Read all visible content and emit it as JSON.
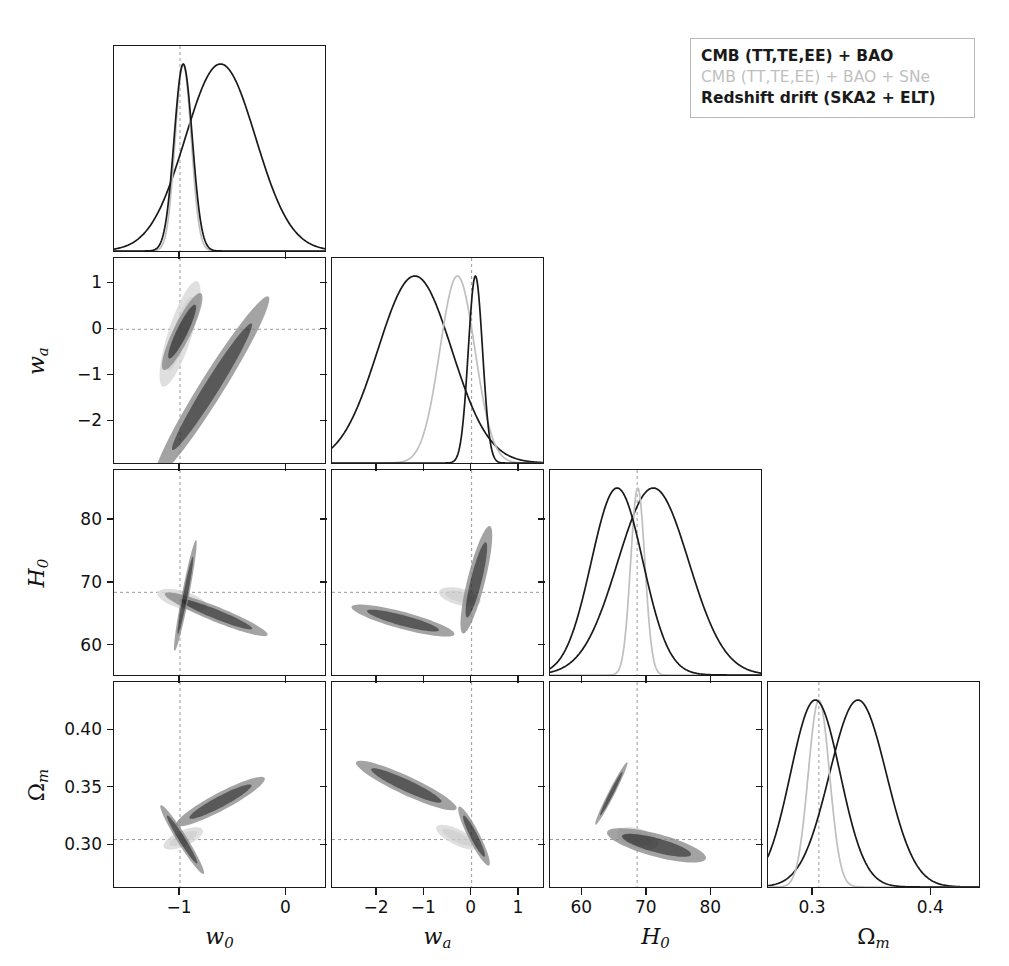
{
  "figure": {
    "type": "corner-plot",
    "background": "#ffffff",
    "frame_color": "#1a1a1a"
  },
  "legend": {
    "position": "top-right",
    "entries": [
      {
        "label": "CMB (TT,TE,EE) + BAO",
        "color": "#1a1a1a",
        "style": "bold"
      },
      {
        "label": "CMB (TT,TE,EE) + BAO + SNe",
        "color": "#bfbfbf",
        "style": "grey"
      },
      {
        "label": "Redshift drift (SKA2 + ELT)",
        "color": "#1a1a1a",
        "style": "bold"
      }
    ]
  },
  "parameters": [
    {
      "key": "w0",
      "label": "w",
      "sub": "0",
      "range": [
        -1.62,
        0.38
      ],
      "ticks": [
        -1,
        0
      ],
      "ticklabels": [
        "−1",
        "0"
      ],
      "fiducial": -1.0
    },
    {
      "key": "wa",
      "label": "w",
      "sub": "a",
      "range": [
        -2.95,
        1.55
      ],
      "ticks": [
        -2,
        -1,
        0,
        1
      ],
      "ticklabels": [
        "−2",
        "−1",
        "0",
        "1"
      ],
      "fiducial": 0.0
    },
    {
      "key": "H0",
      "label": "H",
      "sub": "0",
      "range": [
        55.0,
        88.0
      ],
      "ticks": [
        60,
        70,
        80
      ],
      "ticklabels": [
        "60",
        "70",
        "80"
      ],
      "fiducial": 68.5
    },
    {
      "key": "Omegam",
      "label": "Ω",
      "sub": "m",
      "range": [
        0.262,
        0.442
      ],
      "ticks": [
        0.3,
        0.35,
        0.4
      ],
      "ticklabels": [
        "0.30",
        "0.35",
        "0.40"
      ],
      "fiducial": 0.305,
      "xticks": [
        0.3,
        0.4
      ],
      "xticklabels": [
        "0.3",
        "0.4"
      ]
    }
  ],
  "chart_data": {
    "type": "line",
    "title": "",
    "xlabel": "",
    "ylabel": "",
    "grid": false,
    "legend_position": "top-right",
    "panel_kind": "corner",
    "axes": {
      "w0": {
        "label": "w0",
        "min": -1.62,
        "max": 0.38,
        "tick_values": [
          -1,
          0
        ]
      },
      "wa": {
        "label": "wa",
        "min": -2.95,
        "max": 1.55,
        "tick_values": [
          -2,
          -1,
          0,
          1
        ]
      },
      "H0": {
        "label": "H0",
        "min": 55.0,
        "max": 88.0,
        "tick_values": [
          60,
          70,
          80
        ]
      },
      "Omegam": {
        "label": "Omega_m",
        "min": 0.262,
        "max": 0.442,
        "tick_values": [
          0.3,
          0.35,
          0.4
        ]
      }
    },
    "series": [
      {
        "name": "CMB (TT,TE,EE) + BAO",
        "color": "#1a1a1a",
        "fill_68": "#2b2b2b",
        "fill_95": "#8a8a8a"
      },
      {
        "name": "CMB (TT,TE,EE) + BAO + SNe",
        "color": "#bfbfbf",
        "fill_68": "#c9c9c9",
        "fill_95": "#d8d8d8"
      },
      {
        "name": "Redshift drift (SKA2 + ELT)",
        "color": "#1a1a1a",
        "fill_68": "#2b2b2b",
        "fill_95": "#8a8a8a"
      }
    ],
    "marginals": {
      "w0": [
        {
          "series": "CMB (TT,TE,EE) + BAO",
          "peak": -0.62,
          "sigma": 0.33
        },
        {
          "series": "CMB (TT,TE,EE) + BAO + SNe",
          "peak": -0.97,
          "sigma": 0.075
        },
        {
          "series": "Redshift drift (SKA2 + ELT)",
          "peak": -0.97,
          "sigma": 0.085
        }
      ],
      "wa": [
        {
          "series": "CMB (TT,TE,EE) + BAO",
          "peak": -1.2,
          "sigma": 0.78
        },
        {
          "series": "CMB (TT,TE,EE) + BAO + SNe",
          "peak": -0.3,
          "sigma": 0.37
        },
        {
          "series": "Redshift drift (SKA2 + ELT)",
          "peak": 0.08,
          "sigma": 0.15
        }
      ],
      "H0": [
        {
          "series": "CMB (TT,TE,EE) + BAO",
          "peak": 71.0,
          "sigma": 5.5
        },
        {
          "series": "CMB (TT,TE,EE) + BAO + SNe",
          "peak": 68.6,
          "sigma": 1.1
        },
        {
          "series": "Redshift drift (SKA2 + ELT)",
          "peak": 65.4,
          "sigma": 4.0
        }
      ],
      "Omegam": [
        {
          "series": "CMB (TT,TE,EE) + BAO",
          "peak": 0.338,
          "sigma": 0.024
        },
        {
          "series": "CMB (TT,TE,EE) + BAO + SNe",
          "peak": 0.305,
          "sigma": 0.009
        },
        {
          "series": "Redshift drift (SKA2 + ELT)",
          "peak": 0.302,
          "sigma": 0.021
        }
      ]
    },
    "contours": {
      "wa_vs_w0": [
        {
          "series": "CMB (TT,TE,EE) + BAO",
          "cx": -0.7,
          "cy": -1.25,
          "a": 1.0,
          "b": 0.115,
          "angle_deg": -58
        },
        {
          "series": "CMB (TT,TE,EE) + BAO + SNe",
          "cx": -1.0,
          "cy": -0.1,
          "a": 0.52,
          "b": 0.115,
          "angle_deg": -72
        },
        {
          "series": "Redshift drift (SKA2 + ELT)",
          "cx": -0.98,
          "cy": -0.05,
          "a": 0.4,
          "b": 0.085,
          "angle_deg": -64
        }
      ],
      "H0_vs_w0": [
        {
          "series": "CMB (TT,TE,EE) + BAO",
          "cx": -0.66,
          "cy": 65.0,
          "a": 0.52,
          "b": 0.072,
          "angle_deg": 22
        },
        {
          "series": "CMB (TT,TE,EE) + BAO + SNe",
          "cx": -0.98,
          "cy": 67.3,
          "a": 0.24,
          "b": 0.085,
          "angle_deg": 16
        },
        {
          "series": "Redshift drift (SKA2 + ELT)",
          "cx": -0.95,
          "cy": 68.0,
          "a": 0.53,
          "b": 0.035,
          "angle_deg": -79
        }
      ],
      "H0_vs_wa": [
        {
          "series": "CMB (TT,TE,EE) + BAO",
          "cx": -1.45,
          "cy": 64.0,
          "a": 0.5,
          "b": 0.082,
          "angle_deg": 15
        },
        {
          "series": "CMB (TT,TE,EE) + BAO + SNe",
          "cx": -0.25,
          "cy": 67.8,
          "a": 0.2,
          "b": 0.08,
          "angle_deg": 14
        },
        {
          "series": "Redshift drift (SKA2 + ELT)",
          "cx": 0.1,
          "cy": 70.5,
          "a": 0.52,
          "b": 0.085,
          "angle_deg": -76
        }
      ],
      "Omegam_vs_w0": [
        {
          "series": "CMB (TT,TE,EE) + BAO",
          "cx": -0.62,
          "cy": 0.338,
          "a": 0.47,
          "b": 0.085,
          "angle_deg": -28
        },
        {
          "series": "CMB (TT,TE,EE) + BAO + SNe",
          "cx": -0.97,
          "cy": 0.306,
          "a": 0.2,
          "b": 0.075,
          "angle_deg": -24
        },
        {
          "series": "Redshift drift (SKA2 + ELT)",
          "cx": -0.98,
          "cy": 0.305,
          "a": 0.38,
          "b": 0.048,
          "angle_deg": 58
        }
      ],
      "Omegam_vs_wa": [
        {
          "series": "CMB (TT,TE,EE) + BAO",
          "cx": -1.38,
          "cy": 0.352,
          "a": 0.52,
          "b": 0.09,
          "angle_deg": 25
        },
        {
          "series": "CMB (TT,TE,EE) + BAO + SNe",
          "cx": -0.3,
          "cy": 0.307,
          "a": 0.22,
          "b": 0.075,
          "angle_deg": 26
        },
        {
          "series": "Redshift drift (SKA2 + ELT)",
          "cx": 0.05,
          "cy": 0.308,
          "a": 0.31,
          "b": 0.055,
          "angle_deg": 63
        }
      ],
      "Omegam_vs_H0": [
        {
          "series": "CMB (TT,TE,EE) + BAO",
          "cx": 71.5,
          "cy": 0.3,
          "a": 0.48,
          "b": 0.11,
          "angle_deg": 15
        },
        {
          "series": "CMB (TT,TE,EE) + BAO + SNe",
          "cx": 68.6,
          "cy": 0.306,
          "a": 0.2,
          "b": 0.095,
          "angle_deg": 16
        },
        {
          "series": "Redshift drift (SKA2 + ELT)",
          "cx": 64.5,
          "cy": 0.345,
          "a": 0.33,
          "b": 0.03,
          "angle_deg": -63
        }
      ]
    },
    "fiducial_lines": {
      "w0": -1.0,
      "wa": 0.0,
      "H0": 68.5,
      "Omegam": 0.305,
      "style": "dashed",
      "color": "#999999"
    }
  }
}
